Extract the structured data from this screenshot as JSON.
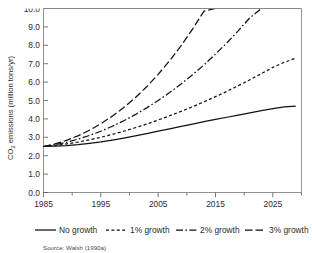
{
  "chart_data": {
    "type": "line",
    "title": "",
    "xlabel": "",
    "ylabel": "CO2 emissions (million tons/yr)",
    "ylabel_parts": {
      "prefix": "CO",
      "subscript": "2",
      "suffix": " emissions (million tons/yr)"
    },
    "xlim": [
      1985,
      2030
    ],
    "ylim": [
      0.0,
      10.0
    ],
    "grid": false,
    "legend_position": "below-axes",
    "x_ticks": [
      1985,
      1995,
      2005,
      2015,
      2025
    ],
    "x_tick_labels": [
      "1985",
      "1995",
      "2005",
      "2015",
      "2025"
    ],
    "x_minor_ticks": [
      1990,
      2000,
      2010,
      2020,
      2030
    ],
    "y_ticks": [
      0.0,
      1.0,
      2.0,
      3.0,
      4.0,
      5.0,
      6.0,
      7.0,
      8.0,
      9.0,
      10.0
    ],
    "y_tick_labels": [
      "0.0",
      "1.0",
      "2.0",
      "3.0",
      "4.0",
      "5.0",
      "6.0",
      "7.0",
      "8.0",
      "9.0",
      "10.0"
    ],
    "x": [
      1985,
      1987,
      1989,
      1991,
      1993,
      1995,
      1997,
      1999,
      2001,
      2003,
      2005,
      2007,
      2009,
      2011,
      2013,
      2015,
      2017,
      2019,
      2021,
      2023,
      2025,
      2027,
      2029
    ],
    "series": [
      {
        "name": "No growth",
        "style": "solid",
        "values": [
          2.5,
          2.52,
          2.55,
          2.6,
          2.67,
          2.75,
          2.85,
          2.96,
          3.08,
          3.2,
          3.33,
          3.46,
          3.59,
          3.72,
          3.85,
          3.97,
          4.09,
          4.21,
          4.33,
          4.45,
          4.56,
          4.65,
          4.7
        ]
      },
      {
        "name": "1% growth",
        "style": "dashed-short",
        "values": [
          2.5,
          2.56,
          2.64,
          2.74,
          2.86,
          3.0,
          3.16,
          3.33,
          3.52,
          3.72,
          3.94,
          4.17,
          4.41,
          4.66,
          4.93,
          5.21,
          5.5,
          5.81,
          6.13,
          6.46,
          6.8,
          7.08,
          7.3
        ]
      },
      {
        "name": "2% growth",
        "style": "dash-dot",
        "values": [
          2.5,
          2.6,
          2.73,
          2.9,
          3.1,
          3.33,
          3.6,
          3.9,
          4.23,
          4.6,
          5.0,
          5.43,
          5.9,
          6.4,
          6.94,
          7.52,
          8.14,
          8.8,
          9.5,
          10.0,
          10.0,
          10.0,
          10.0
        ]
      },
      {
        "name": "3% growth",
        "style": "dashed-long",
        "values": [
          2.5,
          2.64,
          2.83,
          3.08,
          3.38,
          3.74,
          4.15,
          4.62,
          5.15,
          5.75,
          6.42,
          7.16,
          7.98,
          8.88,
          9.86,
          10.0,
          10.0,
          10.0,
          10.0,
          10.0,
          10.0,
          10.0,
          10.0
        ]
      }
    ],
    "legend": [
      {
        "label": "No growth",
        "style": "solid"
      },
      {
        "label": "1% growth",
        "style": "dashed-short"
      },
      {
        "label": "2% growth",
        "style": "dash-dot"
      },
      {
        "label": "3% growth",
        "style": "dashed-long"
      }
    ],
    "annotations": {
      "source": "Source: Walsh (1990a)"
    }
  }
}
